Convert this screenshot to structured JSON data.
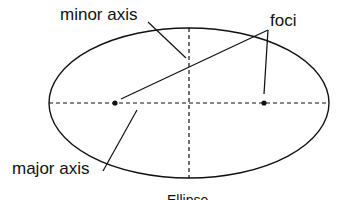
{
  "diagram": {
    "title": "Ellipse",
    "labels": {
      "minor_axis": "minor axis",
      "foci": "foci",
      "major_axis": "major axis"
    },
    "colors": {
      "stroke": "#111111",
      "background": "#ffffff"
    }
  }
}
